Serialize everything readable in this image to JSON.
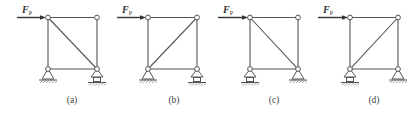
{
  "figure": {
    "force_label": "F",
    "force_subscript": "P",
    "panels": [
      {
        "id": "a",
        "caption": "(a)",
        "diagonal": "top-left to bottom-right",
        "left_support": "pin",
        "right_support": "roller"
      },
      {
        "id": "b",
        "caption": "(b)",
        "diagonal": "bottom-left to top-right",
        "left_support": "pin",
        "right_support": "roller"
      },
      {
        "id": "c",
        "caption": "(c)",
        "diagonal": "top-left to bottom-right",
        "left_support": "roller",
        "right_support": "pin"
      },
      {
        "id": "d",
        "caption": "(d)",
        "diagonal": "bottom-left to top-right",
        "left_support": "roller",
        "right_support": "pin"
      }
    ]
  }
}
